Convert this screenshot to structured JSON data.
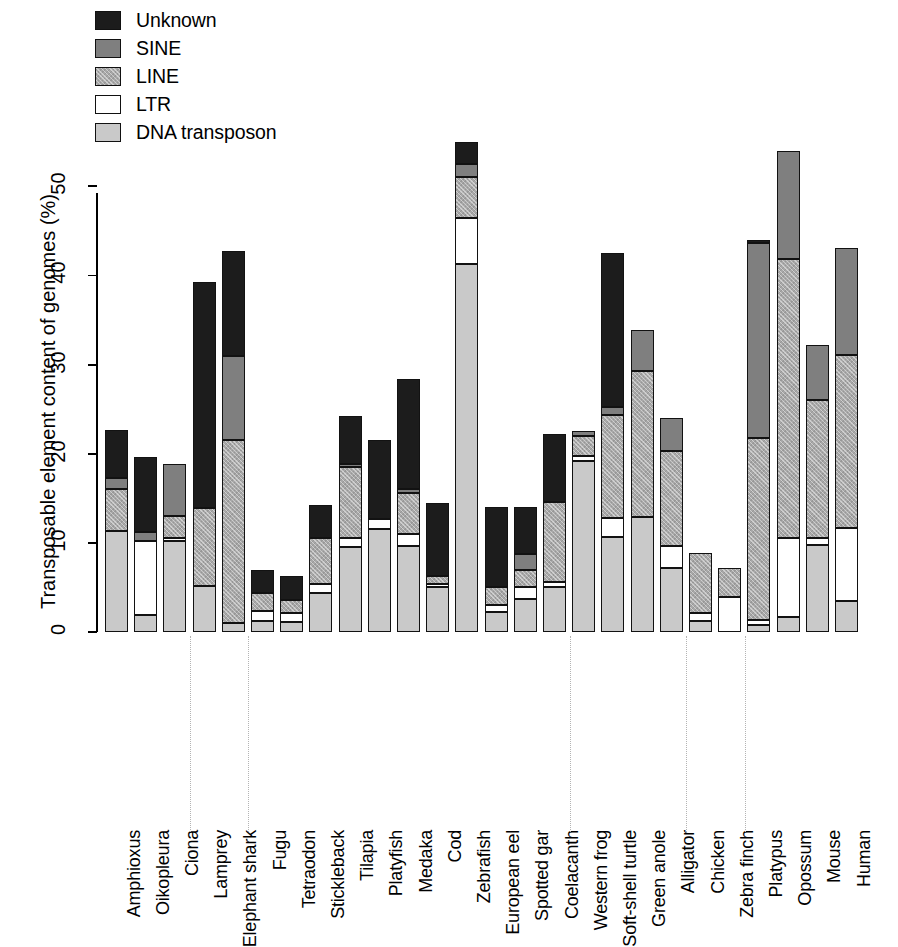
{
  "chart_data": {
    "type": "bar",
    "subtype": "stacked",
    "title": "",
    "xlabel": "",
    "ylabel": "Transposable element content of genomes (%)",
    "ylim": [
      0,
      55
    ],
    "yticks": [
      0,
      10,
      20,
      30,
      40,
      50
    ],
    "grid": false,
    "legend_position": "top-left",
    "legend_order_top_to_bottom": [
      "Unknown",
      "SINE",
      "LINE",
      "LTR",
      "DNA transposon"
    ],
    "stack_order_bottom_to_top": [
      "DNA transposon",
      "LTR",
      "LINE",
      "SINE",
      "Unknown"
    ],
    "series": [
      {
        "name": "DNA transposon",
        "color": "#c9c9c9",
        "values": [
          11.3,
          1.9,
          10.2,
          5.2,
          1.0,
          1.2,
          1.1,
          4.4,
          9.5,
          11.6,
          9.7,
          5.1,
          41.3,
          2.2,
          3.7,
          5.1,
          19.2,
          10.7,
          12.9,
          7.2,
          1.2,
          0.0,
          0.8,
          1.7,
          9.8,
          3.5
        ]
      },
      {
        "name": "LTR",
        "color": "#ffffff",
        "values": [
          0.0,
          8.3,
          0.3,
          0.0,
          0.0,
          1.2,
          1.0,
          1.0,
          1.1,
          1.1,
          1.3,
          0.3,
          5.2,
          0.8,
          1.4,
          0.5,
          0.6,
          2.1,
          0.0,
          2.5,
          0.9,
          3.9,
          0.5,
          8.9,
          0.8,
          8.2
        ]
      },
      {
        "name": "LINE",
        "color": "#a8a8a8",
        "values": [
          4.8,
          0.0,
          2.5,
          8.7,
          20.5,
          2.0,
          1.5,
          5.2,
          7.9,
          0.0,
          4.6,
          0.9,
          4.5,
          2.1,
          1.9,
          9.0,
          2.2,
          11.6,
          16.4,
          10.6,
          6.8,
          3.3,
          20.5,
          31.3,
          15.4,
          19.4
        ]
      },
      {
        "name": "SINE",
        "color": "#7f7f7f",
        "values": [
          1.2,
          1.0,
          5.9,
          0.0,
          9.5,
          0.0,
          0.0,
          0.0,
          0.3,
          0.0,
          0.4,
          0.0,
          1.5,
          0.0,
          1.7,
          0.0,
          0.5,
          0.9,
          4.6,
          3.7,
          0.0,
          0.0,
          21.9,
          12.1,
          6.2,
          12.0
        ]
      },
      {
        "name": "Unknown",
        "color": "#1c1c1c",
        "values": [
          5.4,
          8.4,
          0.0,
          25.4,
          11.8,
          2.6,
          2.7,
          3.6,
          5.4,
          8.8,
          12.4,
          8.2,
          2.5,
          8.9,
          5.3,
          7.6,
          0.0,
          17.2,
          0.0,
          0.0,
          0.0,
          0.0,
          0.3,
          0.0,
          0.0,
          0.0
        ]
      }
    ],
    "categories": [
      "Amphioxus",
      "Oikopleura",
      "Ciona",
      "Lamprey",
      "Elephant shark",
      "Fugu",
      "Tetraodon",
      "Stickleback",
      "Tilapia",
      "Platyfish",
      "Medaka",
      "Cod",
      "Zebrafish",
      "European eel",
      "Spotted gar",
      "Coelacanth",
      "Western frog",
      "Soft-shell turtle",
      "Green anole",
      "Alligator",
      "Chicken",
      "Zebra finch",
      "Platypus",
      "Opossum",
      "Mouse",
      "Human"
    ],
    "totals": [
      22.7,
      19.6,
      18.9,
      39.3,
      42.8,
      7.0,
      6.3,
      14.2,
      24.2,
      21.5,
      28.4,
      14.5,
      55.0,
      14.0,
      14.0,
      22.2,
      22.5,
      42.5,
      33.9,
      24.0,
      8.9,
      7.2,
      44.0,
      54.0,
      32.2,
      43.1
    ],
    "group_separators_after": [
      "Ciona",
      "Elephant shark",
      "Coelacanth",
      "Alligator",
      "Zebra finch"
    ]
  },
  "legend": {
    "items": [
      {
        "label": "Unknown",
        "fill": "f-unknown"
      },
      {
        "label": "SINE",
        "fill": "f-sine"
      },
      {
        "label": "LINE",
        "fill": "f-line"
      },
      {
        "label": "LTR",
        "fill": "f-ltr"
      },
      {
        "label": "DNA transposon",
        "fill": "f-dna"
      }
    ]
  },
  "axis": {
    "y_title": "Transposable element content of genomes (%)",
    "y_tick_labels": [
      "0",
      "10",
      "20",
      "30",
      "40",
      "50"
    ]
  }
}
